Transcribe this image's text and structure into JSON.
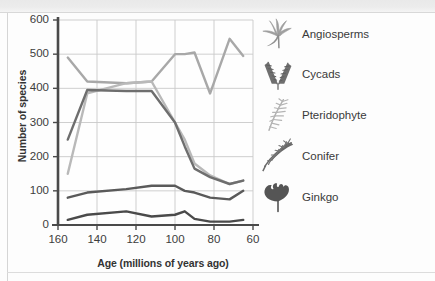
{
  "chart_data": {
    "type": "line",
    "title": "",
    "xlabel": "Age (millions of years ago)",
    "ylabel": "Number of species",
    "xlim": [
      160,
      60
    ],
    "ylim": [
      0,
      600
    ],
    "x_ticks": [
      160,
      140,
      120,
      100,
      80,
      60
    ],
    "y_ticks": [
      0,
      100,
      200,
      300,
      400,
      500,
      600
    ],
    "x_axis_reversed": true,
    "grid": true,
    "legend_position": "right",
    "x": [
      155,
      145,
      125,
      112,
      100,
      95,
      90,
      82,
      72,
      65
    ],
    "series": [
      {
        "name": "Angiosperms",
        "color": "#b9b9b9",
        "values": [
          150,
          385,
          415,
          420,
          300,
          250,
          180,
          145,
          120,
          130
        ]
      },
      {
        "name": "Cycads",
        "color": "#6e6e6e",
        "values": [
          250,
          395,
          392,
          392,
          300,
          230,
          165,
          140,
          120,
          130
        ]
      },
      {
        "name": "Pteridophyte",
        "color": "#a8a8a8",
        "values": [
          490,
          420,
          415,
          420,
          500,
          500,
          505,
          385,
          545,
          495
        ]
      },
      {
        "name": "Conifer",
        "color": "#5a5a5a",
        "values": [
          80,
          95,
          105,
          115,
          115,
          100,
          95,
          80,
          75,
          100
        ]
      },
      {
        "name": "Ginkgo",
        "color": "#4a4a4a",
        "values": [
          15,
          30,
          40,
          25,
          30,
          40,
          18,
          10,
          10,
          15
        ]
      }
    ]
  },
  "legend": {
    "items": [
      {
        "label": "Angiosperms",
        "icon": "angiosperm-flower-icon"
      },
      {
        "label": "Cycads",
        "icon": "cycad-frond-icon"
      },
      {
        "label": "Pteridophyte",
        "icon": "fern-frond-icon"
      },
      {
        "label": "Conifer",
        "icon": "conifer-branch-icon"
      },
      {
        "label": "Ginkgo",
        "icon": "ginkgo-leaf-icon"
      }
    ]
  },
  "axes": {
    "y_tick_labels": [
      "600",
      "500",
      "400",
      "300",
      "200",
      "100",
      "0"
    ],
    "x_tick_labels": [
      "160",
      "140",
      "120",
      "100",
      "80",
      "60"
    ],
    "x_title": "Age (millions of years ago)",
    "y_title": "Number of species"
  },
  "colors": {
    "grid": "#c9c9c9",
    "axis": "#555555",
    "page_background": "#fdfdfd",
    "scan_band": "#ececec"
  }
}
